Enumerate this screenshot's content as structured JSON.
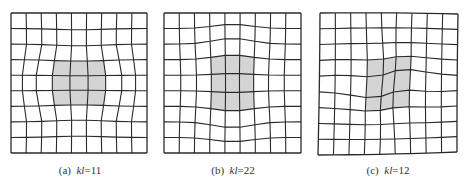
{
  "figure": {
    "panels": [
      {
        "id": "a",
        "label": "(a)",
        "variable": "kl",
        "value": "=11",
        "center_x": 80,
        "box": [
          11,
          13,
          147,
          153
        ],
        "cells": 9,
        "shaded_region": "horizontal rounded-rectangle (3x3 cells) at center"
      },
      {
        "id": "b",
        "label": "(b)",
        "variable": "kl",
        "value": "=22",
        "center_x": 233,
        "box": [
          164,
          13,
          301,
          153
        ],
        "cells": 9,
        "shaded_region": "vertical barrel-shaped region (3x3 cells) at center"
      },
      {
        "id": "c",
        "label": "(c)",
        "variable": "kl",
        "value": "=12",
        "center_x": 388,
        "box": [
          320,
          13,
          458,
          155
        ],
        "cells": 9,
        "shaded_region": "sheared parallelogram (3x3 cells) at center"
      }
    ],
    "colors": {
      "line": "#2a2a2a",
      "shade": "#d4d4d4",
      "background": "#ffffff"
    }
  }
}
